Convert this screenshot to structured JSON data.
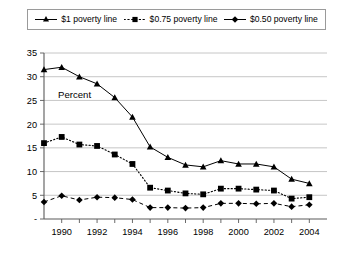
{
  "legend": {
    "entries": [
      {
        "label": "$1 poverty line",
        "marker": "triangle-marker",
        "style": "solid"
      },
      {
        "label": "$0.75 poverty line",
        "marker": "square-marker",
        "style": "dotted"
      },
      {
        "label": "$0.50 poverty line",
        "marker": "diamond-marker",
        "style": "dashed"
      }
    ]
  },
  "annotations": {
    "percent_label": "Percent"
  },
  "chart_data": {
    "type": "line",
    "title": "",
    "subtitle": "",
    "xlabel": "",
    "ylabel": "Percent",
    "xlim": [
      1989,
      2005
    ],
    "ylim": [
      0,
      35
    ],
    "grid": true,
    "legend_position": "top",
    "x": [
      1989,
      1990,
      1991,
      1992,
      1993,
      1994,
      1995,
      1996,
      1997,
      1998,
      1999,
      2000,
      2001,
      2002,
      2003,
      2004,
      2005
    ],
    "xtick_labels": [
      "1990",
      "1992",
      "1994",
      "1996",
      "1998",
      "2000",
      "2002",
      "2004"
    ],
    "xticks": [
      1990,
      1992,
      1994,
      1996,
      1998,
      2000,
      2002,
      2004
    ],
    "ytick_labels": [
      "-",
      "5",
      "10",
      "15",
      "20",
      "25",
      "30",
      "35"
    ],
    "yticks": [
      0,
      5,
      10,
      15,
      20,
      25,
      30,
      35
    ],
    "series": [
      {
        "name": "$1 poverty line",
        "marker": "triangle",
        "linestyle": "solid",
        "color": "#000000",
        "values": [
          31.5,
          32.0,
          30.0,
          28.5,
          25.6,
          21.5,
          15.2,
          13.0,
          11.4,
          11.0,
          12.3,
          11.6,
          11.6,
          11.0,
          8.4,
          7.5,
          null
        ]
      },
      {
        "name": "$0.75 poverty line",
        "marker": "square",
        "linestyle": "dotted",
        "color": "#000000",
        "values": [
          16.0,
          17.3,
          15.7,
          15.4,
          13.6,
          11.6,
          6.6,
          6.0,
          5.4,
          5.2,
          6.4,
          6.4,
          6.2,
          6.0,
          4.3,
          4.6,
          null
        ]
      },
      {
        "name": "$0.50 poverty line",
        "marker": "diamond",
        "linestyle": "dashed",
        "color": "#000000",
        "values": [
          3.6,
          4.9,
          4.0,
          4.6,
          4.5,
          4.1,
          2.4,
          2.4,
          2.3,
          2.4,
          3.3,
          3.3,
          3.2,
          3.3,
          2.6,
          3.0,
          null
        ]
      }
    ]
  }
}
